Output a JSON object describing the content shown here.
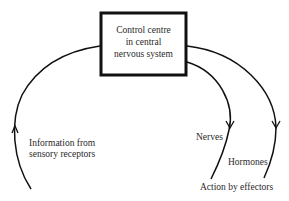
{
  "diagram": {
    "box": {
      "lines": [
        "Control centre",
        "in central",
        "nervous system"
      ]
    },
    "labels": {
      "input": [
        "Information from",
        "sensory receptors"
      ],
      "nerves": "Nerves",
      "hormones": "Hormones",
      "output": "Action by effectors"
    },
    "colors": {
      "line": "#111111",
      "text": "#2a2a2a",
      "background": "#ffffff"
    },
    "arrows": [
      {
        "path": "input-pathway",
        "direction": "up"
      },
      {
        "path": "nerve-pathway",
        "direction": "down"
      },
      {
        "path": "hormone-pathway",
        "direction": "down"
      }
    ]
  }
}
